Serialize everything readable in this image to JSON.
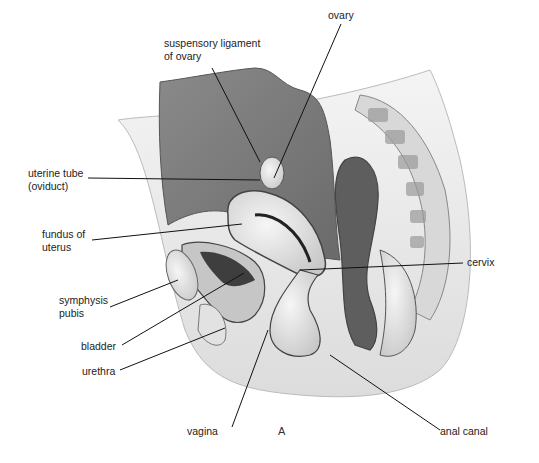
{
  "figure": {
    "panel_letter": "A",
    "colors": {
      "background": "#ffffff",
      "peritoneal_cavity": "#7a7a7a",
      "rectum_dark": "#5a5a5a",
      "tissue_light": "#e8e8e8",
      "outline": "#444444",
      "leader_line": "#111111"
    }
  },
  "labels": {
    "suspensory_ligament": {
      "line1": "suspensory ligament",
      "line2": "of ovary"
    },
    "ovary": {
      "line1": "ovary"
    },
    "uterine_tube": {
      "line1": "uterine tube",
      "line2": "(oviduct)"
    },
    "fundus": {
      "line1": "fundus of",
      "line2": "uterus"
    },
    "cervix": {
      "line1": "cervix"
    },
    "symphysis": {
      "line1": "symphysis",
      "line2": "pubis"
    },
    "bladder": {
      "line1": "bladder"
    },
    "urethra": {
      "line1": "urethra"
    },
    "vagina": {
      "line1": "vagina"
    },
    "anal_canal": {
      "line1": "anal canal"
    }
  }
}
